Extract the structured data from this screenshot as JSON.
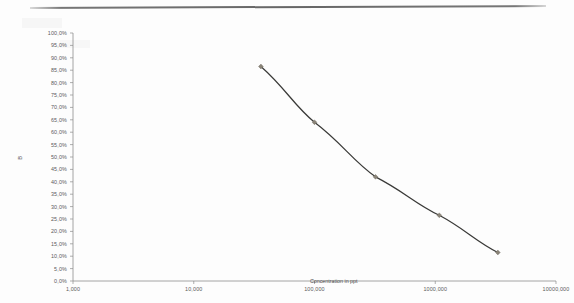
{
  "page": {
    "background_color": "#fdfdfd",
    "scan_rule_color": "#5e5e5e"
  },
  "chart_data": {
    "type": "line",
    "title": "",
    "subtitle": "",
    "xlabel": "Concentration in ppt",
    "ylabel": "B",
    "xscale": "log",
    "yscale": "linear",
    "grid": false,
    "legend": "none",
    "line_color": "#3a3a38",
    "marker_color": "#8a8478",
    "marker_shape": "diamond",
    "axis_color": "#8d8d8d",
    "xlim": [
      1000,
      10000000
    ],
    "ylim": [
      0,
      100
    ],
    "x_tick_labels": [
      "1,000",
      "10,000",
      "100,000",
      "1000,000",
      "10000,000"
    ],
    "x_tick_values": [
      1000,
      10000,
      100000,
      1000000,
      10000000
    ],
    "y_tick_labels": [
      "100,0%",
      "95,0%",
      "90,0%",
      "85,0%",
      "80,0%",
      "75,0%",
      "70,0%",
      "65,0%",
      "60,0%",
      "55,0%",
      "50,0%",
      "45,0%",
      "40,0%",
      "35,0%",
      "30,0%",
      "25,0%",
      "20,0%",
      "15,0%",
      "10,0%",
      "5,0%",
      "0,0%"
    ],
    "y_tick_values": [
      100,
      95,
      90,
      85,
      80,
      75,
      70,
      65,
      60,
      55,
      50,
      45,
      40,
      35,
      30,
      25,
      20,
      15,
      10,
      5,
      0
    ],
    "x": [
      36000,
      100000,
      320000,
      1080000,
      3300000
    ],
    "values": [
      86.5,
      64.0,
      42.0,
      26.5,
      11.5
    ],
    "points": [
      {
        "x": 36000,
        "y": 86.5
      },
      {
        "x": 100000,
        "y": 64.0
      },
      {
        "x": 320000,
        "y": 42.0
      },
      {
        "x": 1080000,
        "y": 26.5
      },
      {
        "x": 3300000,
        "y": 11.5
      }
    ]
  }
}
